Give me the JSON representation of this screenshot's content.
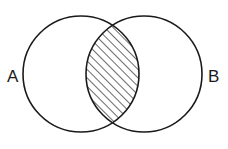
{
  "diagram": {
    "kind": "venn-diagram",
    "background_color": "#ffffff",
    "stroke_color": "#1a1a1a",
    "stroke_width": 1.6,
    "canvas": {
      "width": 228,
      "height": 149
    },
    "labels": {
      "left": "A",
      "right": "B"
    },
    "label_positions": {
      "left": {
        "x": 7,
        "y": 82
      },
      "right": {
        "x": 208,
        "y": 82
      }
    },
    "sets": [
      {
        "name": "set-a",
        "label": "A",
        "center": {
          "x": 81,
          "y": 74
        },
        "radius": 58
      },
      {
        "name": "set-b",
        "label": "B",
        "center": {
          "x": 144,
          "y": 74
        },
        "radius": 58
      }
    ],
    "intersection": {
      "name": "intersection-region",
      "shaded": true,
      "fill_pattern": "diagonal-hatch",
      "hatch": {
        "angle_degrees": 45,
        "direction": "lower-left-to-upper-right",
        "spacing": 6,
        "line_width": 1.3,
        "color": "#1a1a1a"
      },
      "crossing_points": [
        {
          "x": 117,
          "y": 23
        },
        {
          "x": 120,
          "y": 127
        }
      ],
      "extent": {
        "left_x": 92,
        "right_x": 139,
        "mid_y": 75
      }
    }
  }
}
